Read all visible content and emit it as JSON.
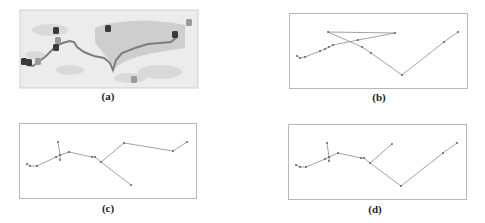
{
  "figure": {
    "panels": [
      {
        "id": "a",
        "caption": "(a)",
        "type": "map",
        "box": [
          20,
          10,
          178,
          78
        ],
        "caption_pos": [
          108,
          98
        ],
        "colors": {
          "land_light": "#ececec",
          "land_dark": "#c4c4c4",
          "route": "#7d7d7d",
          "marker": "#3a3a3a",
          "marker_light": "#9a9a9a"
        },
        "route": [
          [
            27,
            65
          ],
          [
            33,
            66
          ],
          [
            38,
            62
          ],
          [
            45,
            57
          ],
          [
            52,
            50
          ],
          [
            60,
            44
          ],
          [
            66,
            42
          ],
          [
            70,
            41
          ],
          [
            74,
            42
          ],
          [
            77,
            47
          ],
          [
            84,
            52
          ],
          [
            94,
            56
          ],
          [
            104,
            58
          ],
          [
            110,
            63
          ],
          [
            113,
            70
          ],
          [
            116,
            60
          ],
          [
            122,
            53
          ],
          [
            135,
            48
          ],
          [
            148,
            44
          ],
          [
            160,
            43
          ],
          [
            171,
            42
          ],
          [
            177,
            37
          ]
        ],
        "markers": [
          {
            "x": 24,
            "y": 62,
            "shade": "dark"
          },
          {
            "x": 29,
            "y": 63,
            "shade": "dark"
          },
          {
            "x": 38,
            "y": 62,
            "shade": "light"
          },
          {
            "x": 56,
            "y": 31,
            "shade": "dark"
          },
          {
            "x": 56,
            "y": 48,
            "shade": "dark"
          },
          {
            "x": 58,
            "y": 41,
            "shade": "light"
          },
          {
            "x": 108,
            "y": 29,
            "shade": "dark"
          },
          {
            "x": 175,
            "y": 35,
            "shade": "dark"
          },
          {
            "x": 189,
            "y": 23,
            "shade": "light"
          },
          {
            "x": 134,
            "y": 80,
            "shade": "light"
          }
        ]
      },
      {
        "id": "b",
        "caption": "(b)",
        "type": "graph",
        "box": [
          289,
          13,
          178,
          75
        ],
        "caption_pos": [
          379,
          99
        ],
        "nodes": [
          [
            297,
            56
          ],
          [
            300,
            58
          ],
          [
            305,
            57
          ],
          [
            320,
            51
          ],
          [
            325,
            49
          ],
          [
            329,
            47
          ],
          [
            333,
            45
          ],
          [
            358,
            40
          ],
          [
            395,
            33
          ],
          [
            328,
            32
          ],
          [
            362,
            47
          ],
          [
            371,
            53
          ],
          [
            402,
            75
          ],
          [
            444,
            42
          ],
          [
            458,
            32
          ]
        ],
        "edges": [
          [
            0,
            1
          ],
          [
            1,
            2
          ],
          [
            2,
            3
          ],
          [
            3,
            4
          ],
          [
            4,
            5
          ],
          [
            5,
            6
          ],
          [
            6,
            7
          ],
          [
            7,
            8
          ],
          [
            8,
            9
          ],
          [
            9,
            10
          ],
          [
            10,
            11
          ],
          [
            11,
            12
          ],
          [
            12,
            13
          ],
          [
            13,
            14
          ]
        ]
      },
      {
        "id": "c",
        "caption": "(c)",
        "type": "graph",
        "box": [
          19,
          123,
          177,
          75
        ],
        "caption_pos": [
          108,
          210
        ],
        "nodes": [
          [
            27,
            164
          ],
          [
            30,
            166
          ],
          [
            37,
            166
          ],
          [
            56,
            157
          ],
          [
            60,
            155
          ],
          [
            58,
            142
          ],
          [
            60,
            160
          ],
          [
            69,
            152
          ],
          [
            92,
            157
          ],
          [
            95,
            157
          ],
          [
            101,
            162
          ],
          [
            124,
            143
          ],
          [
            173,
            151
          ],
          [
            187,
            142
          ],
          [
            131,
            185
          ]
        ],
        "edges": [
          [
            0,
            1
          ],
          [
            1,
            2
          ],
          [
            2,
            3
          ],
          [
            3,
            4
          ],
          [
            4,
            5
          ],
          [
            4,
            6
          ],
          [
            4,
            7
          ],
          [
            7,
            8
          ],
          [
            8,
            9
          ],
          [
            9,
            10
          ],
          [
            10,
            11
          ],
          [
            11,
            12
          ],
          [
            12,
            13
          ],
          [
            10,
            14
          ]
        ]
      },
      {
        "id": "d",
        "caption": "(d)",
        "type": "graph",
        "box": [
          288,
          124,
          178,
          75
        ],
        "caption_pos": [
          375,
          211
        ],
        "nodes": [
          [
            296,
            165
          ],
          [
            300,
            167
          ],
          [
            306,
            167
          ],
          [
            325,
            159
          ],
          [
            329,
            157
          ],
          [
            327,
            143
          ],
          [
            329,
            161
          ],
          [
            338,
            153
          ],
          [
            361,
            158
          ],
          [
            364,
            158
          ],
          [
            370,
            163
          ],
          [
            392,
            144
          ],
          [
            401,
            186
          ],
          [
            443,
            153
          ],
          [
            457,
            143
          ]
        ],
        "edges": [
          [
            0,
            1
          ],
          [
            1,
            2
          ],
          [
            2,
            3
          ],
          [
            3,
            4
          ],
          [
            4,
            5
          ],
          [
            4,
            6
          ],
          [
            4,
            7
          ],
          [
            7,
            8
          ],
          [
            8,
            9
          ],
          [
            9,
            10
          ],
          [
            10,
            11
          ],
          [
            10,
            12
          ],
          [
            12,
            13
          ],
          [
            13,
            14
          ]
        ]
      }
    ],
    "style": {
      "edge_color": "#8a8a8a",
      "node_color": "#555555",
      "frame_color": "#b8b8b8"
    }
  }
}
